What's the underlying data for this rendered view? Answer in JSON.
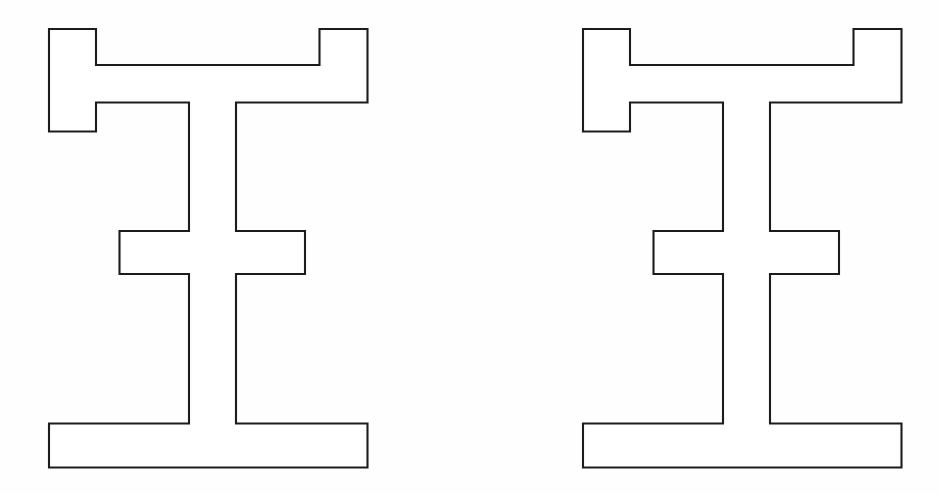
{
  "canvas": {
    "width": 941,
    "height": 494,
    "background_color": "#fefefe",
    "stroke_color": "#1c1c1c",
    "fill_color": "#ffffff",
    "stroke_width": 2.1,
    "description": "Two identical closed polygonal line-drawings of an I-beam / H-shaped profile with stepped top flange notches, side by side on a plain white background."
  },
  "chart_data": {
    "type": "scatter",
    "title": "",
    "subtitle": "",
    "xlabel": "",
    "ylabel": "",
    "xlim": [
      0,
      941
    ],
    "ylim": [
      0,
      494
    ],
    "grid": false,
    "legend": "none",
    "annotations": [],
    "series": [
      {
        "name": "figure-left",
        "shape": "closed-polygon",
        "closed": true,
        "vertex_count": 26,
        "bbox": {
          "x": 49,
          "y": 29,
          "width": 318.5,
          "height": 438.5
        },
        "points": [
          [
            49,
            29
          ],
          [
            96,
            29
          ],
          [
            96,
            65
          ],
          [
            319.5,
            65
          ],
          [
            319.5,
            29
          ],
          [
            367.5,
            29
          ],
          [
            367.5,
            102.5
          ],
          [
            236,
            102.5
          ],
          [
            236,
            231
          ],
          [
            305,
            231
          ],
          [
            305,
            274
          ],
          [
            236,
            274
          ],
          [
            236,
            423.5
          ],
          [
            367.5,
            423.5
          ],
          [
            367.5,
            467.5
          ],
          [
            49,
            467.5
          ],
          [
            49,
            423.5
          ],
          [
            189,
            423.5
          ],
          [
            189,
            274
          ],
          [
            119.5,
            274
          ],
          [
            119.5,
            231
          ],
          [
            189,
            231
          ],
          [
            189,
            102.5
          ],
          [
            96,
            102.5
          ],
          [
            96,
            131.5
          ],
          [
            49,
            131.5
          ]
        ]
      },
      {
        "name": "figure-right",
        "shape": "closed-polygon",
        "closed": true,
        "vertex_count": 26,
        "bbox": {
          "x": 583,
          "y": 29,
          "width": 318.5,
          "height": 438.5
        },
        "translate_from_left": [
          534,
          0
        ],
        "points": [
          [
            583,
            29
          ],
          [
            630,
            29
          ],
          [
            630,
            65
          ],
          [
            853.5,
            65
          ],
          [
            853.5,
            29
          ],
          [
            901.5,
            29
          ],
          [
            901.5,
            102.5
          ],
          [
            770,
            102.5
          ],
          [
            770,
            231
          ],
          [
            839,
            231
          ],
          [
            839,
            274
          ],
          [
            770,
            274
          ],
          [
            770,
            423.5
          ],
          [
            901.5,
            423.5
          ],
          [
            901.5,
            467.5
          ],
          [
            583,
            467.5
          ],
          [
            583,
            423.5
          ],
          [
            723,
            423.5
          ],
          [
            723,
            274
          ],
          [
            653.5,
            274
          ],
          [
            653.5,
            231
          ],
          [
            723,
            231
          ],
          [
            723,
            102.5
          ],
          [
            630,
            102.5
          ],
          [
            630,
            131.5
          ],
          [
            583,
            131.5
          ]
        ]
      }
    ]
  }
}
